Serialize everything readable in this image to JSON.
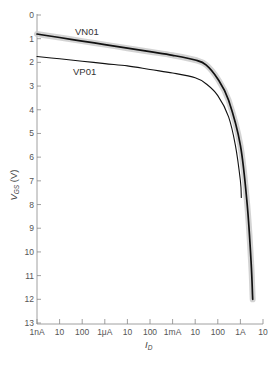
{
  "chart_data": {
    "type": "line",
    "title": "",
    "xlabel": "I_D",
    "ylabel": "V_GS (V)",
    "xscale": "log",
    "xlim_amps": [
      1e-09,
      10
    ],
    "ylim": [
      0,
      13
    ],
    "y_inverted": true,
    "grid": false,
    "x_tick_labels": [
      "1nA",
      "10",
      "100",
      "1μA",
      "10",
      "100",
      "1mA",
      "10",
      "100",
      "1A",
      "10"
    ],
    "y_tick_labels": [
      "0",
      "1",
      "2",
      "3",
      "4",
      "5",
      "6",
      "7",
      "8",
      "9",
      "10",
      "11",
      "12",
      "13"
    ],
    "series": [
      {
        "name": "VN01",
        "style": "thick black line with gray shaded band",
        "x_amps": [
          1e-09,
          1e-08,
          1e-07,
          1e-06,
          1e-05,
          0.0001,
          0.001,
          0.01,
          0.03,
          0.1,
          0.3,
          1,
          2,
          3,
          3.5
        ],
        "y_volts": [
          0.8,
          0.95,
          1.1,
          1.25,
          1.4,
          1.55,
          1.7,
          1.9,
          2.1,
          2.7,
          3.6,
          5.5,
          8.0,
          10.5,
          12.0
        ]
      },
      {
        "name": "VP01",
        "style": "thin black line",
        "x_amps": [
          1e-09,
          1e-08,
          1e-07,
          1e-06,
          1e-05,
          0.0001,
          0.001,
          0.01,
          0.03,
          0.1,
          0.3,
          0.6,
          1,
          1.1
        ],
        "y_volts": [
          1.75,
          1.85,
          1.95,
          2.05,
          2.15,
          2.3,
          2.45,
          2.65,
          2.9,
          3.4,
          4.3,
          5.5,
          7.0,
          7.7
        ]
      }
    ],
    "annotations": [
      {
        "text": "VN01",
        "near": "upper curve, around 10nA–100nA"
      },
      {
        "text": "VP01",
        "near": "lower curve, around 10nA–100nA"
      }
    ]
  },
  "labels": {
    "vn01": "VN01",
    "vp01": "VP01",
    "xlabel_main": "I",
    "xlabel_sub": "D",
    "ylabel_main": "V",
    "ylabel_sub": "GS",
    "ylabel_unit": " (V)"
  }
}
